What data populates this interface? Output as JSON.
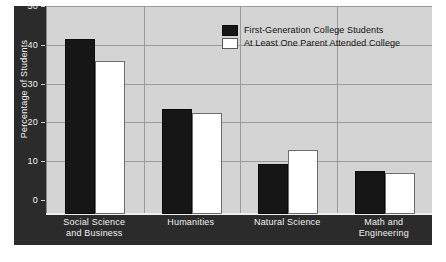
{
  "chart_data": {
    "type": "bar",
    "title": "",
    "subtitle": "",
    "xlabel": "",
    "ylabel": "Percentage of Students",
    "ylim": [
      0,
      50
    ],
    "yticks": [
      0,
      10,
      20,
      30,
      40,
      50
    ],
    "ytick_labels": [
      "0",
      "10",
      "20",
      "30",
      "40",
      "50"
    ],
    "grid": true,
    "legend_position": "top-right-inside",
    "categories": [
      "Social Science and Business",
      "Humanities",
      "Natural Science",
      "Math and Engineering"
    ],
    "category_lines": [
      [
        "Social Science",
        "and Business"
      ],
      [
        "Humanities",
        ""
      ],
      [
        "Natural Science",
        ""
      ],
      [
        "Math and",
        "Engineering"
      ]
    ],
    "series": [
      {
        "name": "First-Generation College Students",
        "color": "#161616",
        "values": [
          45,
          27,
          13,
          11
        ]
      },
      {
        "name": "At Least One Parent Attended College",
        "color": "#ffffff",
        "values": [
          39.5,
          26,
          16.5,
          10.5
        ]
      }
    ]
  },
  "colors": {
    "plot_background": "#d4d4d4",
    "frame": "#2b2b2b",
    "gridline": "#9a9a9a",
    "axis_text": "#f2f2f2",
    "legend_text": "#111111",
    "page_background": "#ffffff"
  }
}
